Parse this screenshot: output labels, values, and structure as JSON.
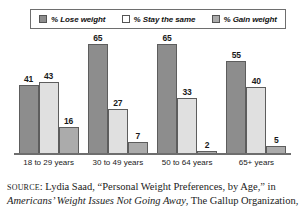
{
  "legend": {
    "items": [
      {
        "label": "% Lose weight",
        "swatch": "#8d8d8d",
        "name": "lose-weight"
      },
      {
        "label": "% Stay the same",
        "swatch": "#ffffff",
        "name": "stay-the-same"
      },
      {
        "label": "% Gain weight",
        "swatch": "#ababab",
        "name": "gain-weight"
      }
    ]
  },
  "chart_data": {
    "type": "bar",
    "title": "",
    "xlabel": "",
    "ylabel": "",
    "ylim": [
      0,
      70
    ],
    "grid": false,
    "legend_position": "top",
    "categories": [
      "18 to 29 years",
      "30 to 49 years",
      "50 to 64 years",
      "65+ years"
    ],
    "series": [
      {
        "name": "% Lose weight",
        "color": "#8d8d8d",
        "values": [
          41,
          65,
          65,
          55
        ]
      },
      {
        "name": "% Stay the same",
        "color": "#e0e0e0",
        "values": [
          43,
          27,
          33,
          40
        ]
      },
      {
        "name": "% Gain weight",
        "color": "#ababab",
        "values": [
          16,
          7,
          2,
          5
        ]
      }
    ]
  },
  "source": {
    "prefix": "SOURCE",
    "colon": ": ",
    "author_and_article": "Lydia Saad, “Personal Weight Preferences, by Age,” in ",
    "publication": "Americans’ Weight Issues Not Going Away",
    "publisher": ", The Gallup Organization,"
  }
}
